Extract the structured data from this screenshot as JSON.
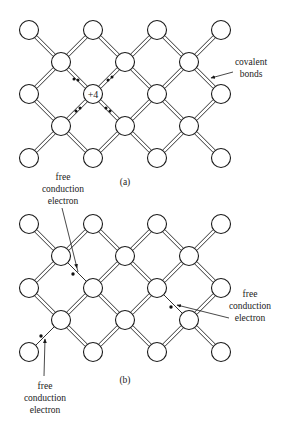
{
  "figure": {
    "panel_a": {
      "caption": "(a)",
      "core_label": "+4",
      "annotation": {
        "line1": "covalent",
        "line2": "bonds"
      }
    },
    "panel_b": {
      "caption": "(b)",
      "annotations": [
        {
          "line1": "free",
          "line2": "conduction",
          "line3": "electron"
        },
        {
          "line1": "free",
          "line2": "conduction",
          "line3": "electron"
        },
        {
          "line1": "free",
          "line2": "conduction",
          "line3": "electron"
        }
      ]
    }
  },
  "colors": {
    "ink": "#1a1a1a",
    "background": "#ffffff"
  }
}
